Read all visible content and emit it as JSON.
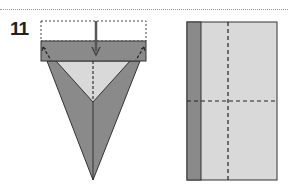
{
  "page": {
    "step_number": "11"
  },
  "diagrams": {
    "left": {
      "name": "folded kite with top flap folded down",
      "arrow": "fold-down-arrow"
    },
    "right": {
      "name": "rectangle with crease lines"
    }
  },
  "colors": {
    "dark_gray": "#8a8a8a",
    "light_gray": "#d9d9d9",
    "outline": "#333333",
    "background": "#ffffff"
  }
}
